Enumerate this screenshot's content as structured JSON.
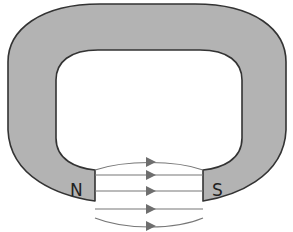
{
  "diagram": {
    "magnet": {
      "fill_color": "#b3b3b3",
      "outline_color": "#333333",
      "poles": [
        {
          "id": "north",
          "label": "N"
        },
        {
          "id": "south",
          "label": "S"
        }
      ]
    },
    "field_lines": {
      "count": 5,
      "direction": "N to S",
      "color": "#777777",
      "arrow_color": "#777777"
    }
  }
}
